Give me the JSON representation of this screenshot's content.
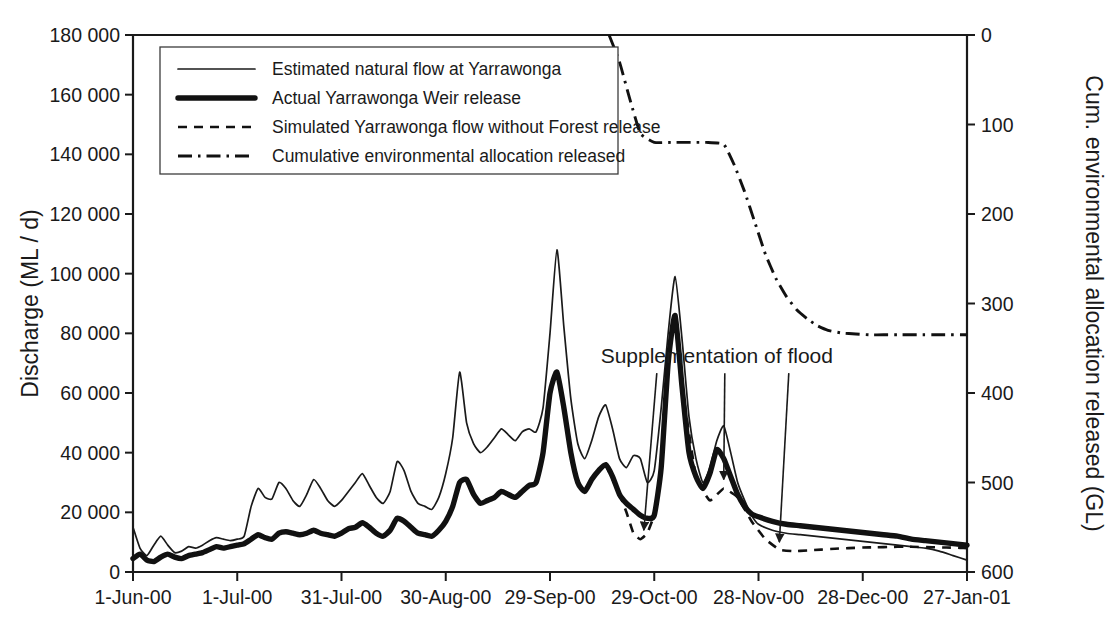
{
  "chart_data": {
    "type": "line",
    "title": "",
    "xlabel": "",
    "ylabel": "Discharge (ML / d)",
    "y2label": "Cum. environmental allocation released (GL)",
    "grid": false,
    "legend_position": "top-left-inside",
    "ylim": [
      0,
      180000
    ],
    "y2lim": [
      0,
      600
    ],
    "xlim": [
      "1-Jun-00",
      "27-Jan-01"
    ],
    "y_ticks": [
      "0",
      "20 000",
      "40 000",
      "60 000",
      "80 000",
      "100 000",
      "120 000",
      "140 000",
      "160 000",
      "180 000"
    ],
    "y_tick_values": [
      0,
      20000,
      40000,
      60000,
      80000,
      100000,
      120000,
      140000,
      160000,
      180000
    ],
    "y2_ticks": [
      "0",
      "100",
      "200",
      "300",
      "400",
      "500",
      "600"
    ],
    "y2_tick_values": [
      0,
      100,
      200,
      300,
      400,
      500,
      600
    ],
    "x_ticks": [
      "1-Jun-00",
      "1-Jul-00",
      "31-Jul-00",
      "30-Aug-00",
      "29-Sep-00",
      "29-Oct-00",
      "28-Nov-00",
      "28-Dec-00",
      "27-Jan-01"
    ],
    "x_tick_day_offsets": [
      0,
      30,
      60,
      90,
      120,
      150,
      180,
      210,
      240
    ],
    "annotations": [
      {
        "text": "Supplementation of flood",
        "x_day": 168,
        "y": 70000
      }
    ],
    "series": [
      {
        "name": "Estimated natural flow at Yarrawonga",
        "style": "thin-solid",
        "axis": "left",
        "units": "ML / d",
        "x_days": [
          0,
          2,
          4,
          6,
          8,
          10,
          12,
          14,
          16,
          18,
          20,
          22,
          24,
          26,
          28,
          30,
          32,
          34,
          36,
          38,
          40,
          42,
          44,
          46,
          48,
          50,
          52,
          54,
          56,
          58,
          60,
          62,
          64,
          66,
          68,
          70,
          72,
          74,
          76,
          78,
          80,
          82,
          84,
          86,
          88,
          90,
          92,
          94,
          96,
          98,
          100,
          102,
          104,
          106,
          108,
          110,
          112,
          114,
          116,
          118,
          120,
          122,
          124,
          126,
          128,
          130,
          132,
          134,
          136,
          138,
          140,
          142,
          144,
          146,
          148,
          150,
          152,
          154,
          156,
          158,
          160,
          162,
          164,
          166,
          168,
          170,
          172,
          174,
          176,
          178,
          180,
          184,
          188,
          192,
          196,
          200,
          204,
          208,
          212,
          216,
          220,
          224,
          228,
          232,
          236,
          240
        ],
        "values": [
          15000,
          8000,
          5500,
          9000,
          12000,
          9000,
          6500,
          7000,
          8500,
          8000,
          9000,
          10500,
          11500,
          11000,
          10500,
          11000,
          12000,
          22000,
          28000,
          25000,
          24500,
          30000,
          28000,
          24000,
          22000,
          26000,
          31000,
          28000,
          24000,
          22000,
          24000,
          27000,
          30000,
          33000,
          29000,
          25000,
          23000,
          27000,
          37000,
          34000,
          27000,
          23000,
          22000,
          21000,
          25000,
          33000,
          45000,
          67000,
          50000,
          43000,
          40000,
          42000,
          45000,
          48000,
          46000,
          44000,
          47000,
          48000,
          47000,
          55000,
          80000,
          108000,
          82000,
          58000,
          43000,
          38000,
          44000,
          52000,
          56000,
          48000,
          38000,
          35000,
          39000,
          38000,
          30000,
          34000,
          55000,
          80000,
          99000,
          78000,
          52000,
          38000,
          30000,
          35000,
          44000,
          49000,
          40000,
          30000,
          24000,
          19000,
          16000,
          14000,
          13000,
          12500,
          12000,
          11500,
          11000,
          10500,
          10000,
          9500,
          9000,
          8500,
          8000,
          7000,
          5500,
          4000
        ]
      },
      {
        "name": "Actual Yarrawonga Weir release",
        "style": "thick-solid",
        "axis": "left",
        "units": "ML / d",
        "x_days": [
          0,
          2,
          4,
          6,
          8,
          10,
          12,
          14,
          16,
          18,
          20,
          22,
          24,
          26,
          28,
          30,
          32,
          34,
          36,
          38,
          40,
          42,
          44,
          46,
          48,
          50,
          52,
          54,
          56,
          58,
          60,
          62,
          64,
          66,
          68,
          70,
          72,
          74,
          76,
          78,
          80,
          82,
          84,
          86,
          88,
          90,
          92,
          94,
          96,
          98,
          100,
          102,
          104,
          106,
          108,
          110,
          112,
          114,
          116,
          118,
          120,
          122,
          124,
          126,
          128,
          130,
          132,
          134,
          136,
          138,
          140,
          142,
          144,
          146,
          148,
          150,
          152,
          154,
          156,
          158,
          160,
          162,
          164,
          166,
          168,
          170,
          172,
          174,
          176,
          178,
          180,
          184,
          188,
          192,
          196,
          200,
          204,
          208,
          212,
          216,
          220,
          224,
          228,
          232,
          236,
          240
        ],
        "values": [
          4500,
          6000,
          4000,
          3500,
          5000,
          6000,
          5000,
          4500,
          5500,
          6000,
          6500,
          7500,
          8500,
          8000,
          8500,
          9000,
          9500,
          11000,
          12500,
          11500,
          11000,
          13000,
          13500,
          13000,
          12500,
          13000,
          14000,
          13000,
          12500,
          12000,
          13000,
          14500,
          15000,
          16500,
          15000,
          13000,
          12000,
          14000,
          18000,
          17000,
          15000,
          13000,
          12500,
          12000,
          14000,
          17000,
          22000,
          30000,
          31000,
          26000,
          23000,
          24000,
          25000,
          27000,
          26000,
          25000,
          27000,
          29000,
          30000,
          40000,
          60000,
          67000,
          55000,
          40000,
          30000,
          27000,
          31000,
          34000,
          36000,
          32000,
          26000,
          23000,
          21000,
          19000,
          18000,
          19000,
          35000,
          70000,
          86000,
          62000,
          40000,
          32000,
          28000,
          33000,
          41000,
          38000,
          32000,
          26000,
          22000,
          19500,
          18500,
          17000,
          16000,
          15500,
          15000,
          14500,
          14000,
          13500,
          13000,
          12500,
          12000,
          11000,
          10500,
          10000,
          9500,
          9000
        ]
      },
      {
        "name": "Simulated Yarrawonga flow without Forest release",
        "style": "dashed",
        "axis": "left",
        "units": "ML / d",
        "segments": [
          {
            "x_days": [
              136,
              140,
              142,
              144,
              146,
              148,
              150
            ],
            "values": [
              36000,
              26000,
              20000,
              13000,
              11000,
              13000,
              19000
            ]
          },
          {
            "x_days": [
              158,
              162,
              166,
              170,
              174,
              178,
              182,
              186,
              190,
              194,
              198,
              202,
              206,
              210,
              214,
              218,
              222,
              226,
              230,
              234,
              238,
              240
            ],
            "values": [
              62000,
              32000,
              24000,
              28000,
              25000,
              17000,
              11000,
              7500,
              7000,
              7200,
              7500,
              7800,
              8000,
              8200,
              8300,
              8400,
              8500,
              8400,
              8300,
              8200,
              8100,
              8000
            ]
          }
        ]
      },
      {
        "name": "Cumulative environmental allocation released",
        "style": "dash-dot",
        "axis": "right",
        "units": "GL",
        "x_days": [
          137,
          140,
          143,
          146,
          150,
          155,
          160,
          165,
          170,
          173,
          176,
          179,
          182,
          185,
          188,
          191,
          194,
          197,
          200,
          204,
          208,
          212,
          216,
          220,
          226,
          232,
          240
        ],
        "values": [
          0,
          30,
          72,
          110,
          120,
          120,
          120,
          120,
          122,
          145,
          175,
          210,
          245,
          272,
          292,
          307,
          317,
          325,
          330,
          333,
          334,
          335,
          335,
          335,
          335,
          335,
          335
        ]
      }
    ]
  },
  "legend": {
    "items": [
      {
        "label": "Estimated natural flow at Yarrawonga",
        "marker": "thin-solid-line-icon"
      },
      {
        "label": "Actual Yarrawonga Weir release",
        "marker": "thick-solid-line-icon"
      },
      {
        "label": "Simulated Yarrawonga flow without Forest release",
        "marker": "dashed-line-icon"
      },
      {
        "label": "Cumulative environmental allocation released",
        "marker": "dash-dot-line-icon"
      }
    ]
  },
  "axes": {
    "left_title": "Discharge (ML / d)",
    "right_title": "Cum. environmental allocation released (GL)"
  }
}
